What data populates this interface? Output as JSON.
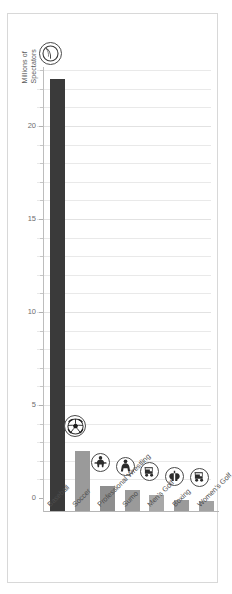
{
  "chart_data": {
    "type": "bar",
    "title": "",
    "xlabel": "",
    "ylabel": "Millions of Spectators",
    "ylabel_line1": "Millions of",
    "ylabel_line2": "Spectators",
    "ylim": [
      0,
      25
    ],
    "ytick_labels": [
      "0",
      "5",
      "10",
      "15",
      "20"
    ],
    "ytick_values": [
      0,
      5,
      10,
      15,
      20
    ],
    "minor_gridlines": true,
    "grid": true,
    "legend": "none",
    "categories": [
      "Baseball",
      "Soccer",
      "Professional Wrestling",
      "Sumo",
      "Men's Golf",
      "Boxing",
      "Women's Golf"
    ],
    "values": [
      23.2,
      3.2,
      1.35,
      1.15,
      0.85,
      0.6,
      0.55
    ],
    "bar_colors": [
      "#3a3a3a",
      "#9a9a9a",
      "#8e8e8e",
      "#9a9a9a",
      "#a8a8a8",
      "#9a9a9a",
      "#a2a2a2"
    ],
    "icons": [
      "baseball-icon",
      "soccer-ball-icon",
      "wrestler-icon",
      "sumo-wrestler-icon",
      "golf-cart-icon",
      "boxing-gloves-icon",
      "golf-cart-icon"
    ]
  },
  "chart": {
    "frame_border_color": "#d8d8d8",
    "gridline_color": "#e9e9e9",
    "axis_color": "#b5b5b5",
    "label_color": "#4d4d4d",
    "tick_label_color": "#6d6d6d"
  }
}
